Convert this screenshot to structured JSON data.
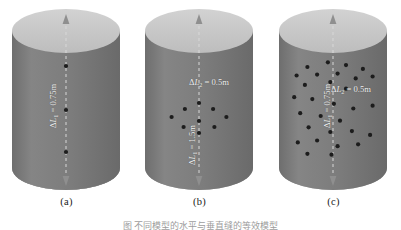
{
  "figure": {
    "caption": "图       不同模型的水平与垂直缝的等效模型",
    "panels": [
      {
        "id": "a",
        "label": "(a)",
        "labels": [
          {
            "text": "ΔL₁ = 0.75m",
            "symbol": "ΔL",
            "sub": "1",
            "value": "0.75m",
            "orientation": "vertical"
          }
        ],
        "dot_count": 3,
        "dots": [
          {
            "x": 0.5,
            "y": 0.33
          },
          {
            "x": 0.5,
            "y": 0.55
          },
          {
            "x": 0.5,
            "y": 0.76
          }
        ],
        "axis": {
          "dashed": true,
          "arrow_top": true,
          "arrow_bottom": true
        }
      },
      {
        "id": "b",
        "label": "(b)",
        "labels": [
          {
            "text": "ΔL₂ = 0.5m",
            "symbol": "ΔL",
            "sub": "2",
            "value": "0.5m",
            "orientation": "horizontal"
          },
          {
            "text": "ΔL₁ = 1.5m",
            "symbol": "ΔL",
            "sub": "1",
            "value": "1.5m",
            "orientation": "vertical"
          }
        ],
        "dot_count": 9,
        "dots": [
          {
            "x": 0.5,
            "y": 0.515
          },
          {
            "x": 0.39,
            "y": 0.545
          },
          {
            "x": 0.61,
            "y": 0.545
          },
          {
            "x": 0.29,
            "y": 0.585
          },
          {
            "x": 0.71,
            "y": 0.585
          },
          {
            "x": 0.5,
            "y": 0.605
          },
          {
            "x": 0.38,
            "y": 0.635
          },
          {
            "x": 0.62,
            "y": 0.635
          },
          {
            "x": 0.5,
            "y": 0.665
          }
        ],
        "axis": {
          "dashed": true,
          "arrow_top": true,
          "arrow_bottom": true
        }
      },
      {
        "id": "c",
        "label": "(c)",
        "labels": [
          {
            "text": "ΔL₂ = 0.5m",
            "symbol": "ΔL",
            "sub": "2",
            "value": "0.5m",
            "orientation": "horizontal"
          },
          {
            "text": "ΔL₁ = 0.75m",
            "symbol": "ΔL",
            "sub": "1",
            "value": "0.75m",
            "orientation": "vertical"
          }
        ],
        "dot_count": 30,
        "dots": [
          {
            "x": 0.3,
            "y": 0.3
          },
          {
            "x": 0.47,
            "y": 0.275
          },
          {
            "x": 0.62,
            "y": 0.29
          },
          {
            "x": 0.76,
            "y": 0.31
          },
          {
            "x": 0.21,
            "y": 0.345
          },
          {
            "x": 0.38,
            "y": 0.34
          },
          {
            "x": 0.55,
            "y": 0.335
          },
          {
            "x": 0.7,
            "y": 0.36
          },
          {
            "x": 0.84,
            "y": 0.35
          },
          {
            "x": 0.28,
            "y": 0.395
          },
          {
            "x": 0.49,
            "y": 0.38
          },
          {
            "x": 0.62,
            "y": 0.415
          },
          {
            "x": 0.19,
            "y": 0.46
          },
          {
            "x": 0.34,
            "y": 0.47
          },
          {
            "x": 0.52,
            "y": 0.495
          },
          {
            "x": 0.68,
            "y": 0.52
          },
          {
            "x": 0.84,
            "y": 0.505
          },
          {
            "x": 0.24,
            "y": 0.545
          },
          {
            "x": 0.41,
            "y": 0.56
          },
          {
            "x": 0.57,
            "y": 0.585
          },
          {
            "x": 0.31,
            "y": 0.62
          },
          {
            "x": 0.49,
            "y": 0.645
          },
          {
            "x": 0.67,
            "y": 0.64
          },
          {
            "x": 0.82,
            "y": 0.66
          },
          {
            "x": 0.22,
            "y": 0.7
          },
          {
            "x": 0.38,
            "y": 0.69
          },
          {
            "x": 0.55,
            "y": 0.72
          },
          {
            "x": 0.72,
            "y": 0.71
          },
          {
            "x": 0.3,
            "y": 0.76
          },
          {
            "x": 0.5,
            "y": 0.765
          }
        ],
        "axis": {
          "dashed": true,
          "arrow_top": true,
          "arrow_bottom": true
        }
      }
    ],
    "colors": {
      "cylinder_body": "#7d7d7d",
      "cylinder_top": "#c9c9c9",
      "cylinder_bottom": "#b0b0b0",
      "dot": "#1c1c1c",
      "axis": "#d8d8d8",
      "label_text": "#f2f2f2",
      "background": "#ffffff"
    }
  }
}
